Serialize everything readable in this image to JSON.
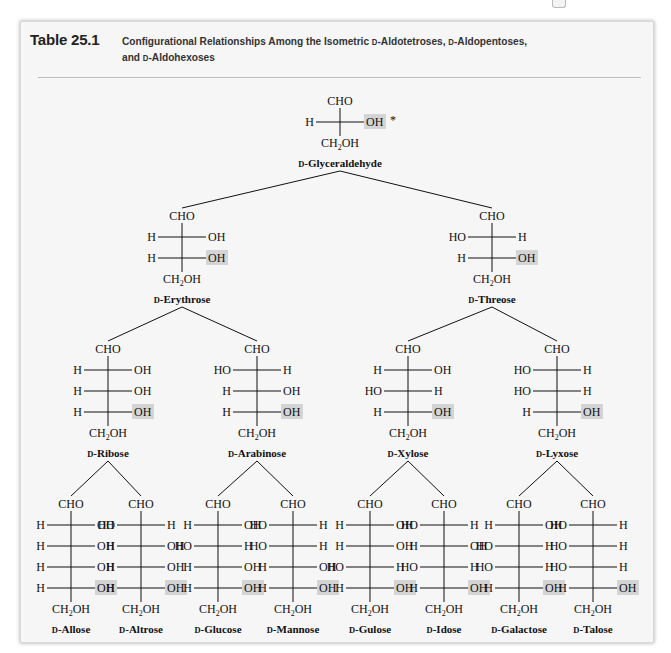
{
  "header": {
    "table_number": "Table 25.1",
    "caption_parts": [
      "Configurational Relationships Among the Isometric ",
      "D",
      "-Aldotetroses, ",
      "D",
      "-Aldopentoses,",
      "and ",
      "D",
      "-Aldohexoses"
    ]
  },
  "colors": {
    "card_bg": "#f6f6f6",
    "highlight": "#d4d4d4",
    "text": "#111111",
    "rule": "#bdbdbd"
  },
  "tree": {
    "asterisk": "*",
    "group_labels": {
      "cho": "CHO",
      "ch2oh_prefix": "CH",
      "ch2oh_sub": "2",
      "ch2oh_suffix": "OH",
      "h": "H",
      "oh": "OH",
      "ho": "HO",
      "d_prefix": "D"
    },
    "nodes": [
      {
        "id": "glyceraldehyde",
        "name": "-Glyceraldehyde",
        "cx": 340,
        "top": 95,
        "config": [
          "R"
        ],
        "highlight_last": true,
        "asterisk": true,
        "parent": null
      },
      {
        "id": "erythrose",
        "name": "-Erythrose",
        "cx": 182,
        "top": 210,
        "config": [
          "R",
          "R"
        ],
        "highlight_last": true,
        "parent": "glyceraldehyde"
      },
      {
        "id": "threose",
        "name": "-Threose",
        "cx": 492,
        "top": 210,
        "config": [
          "L",
          "R"
        ],
        "highlight_last": true,
        "parent": "glyceraldehyde"
      },
      {
        "id": "ribose",
        "name": "-Ribose",
        "cx": 108,
        "top": 343,
        "config": [
          "R",
          "R",
          "R"
        ],
        "highlight_last": true,
        "parent": "erythrose"
      },
      {
        "id": "arabinose",
        "name": "-Arabinose",
        "cx": 257,
        "top": 343,
        "config": [
          "L",
          "R",
          "R"
        ],
        "highlight_last": true,
        "parent": "erythrose"
      },
      {
        "id": "xylose",
        "name": "-Xylose",
        "cx": 408,
        "top": 343,
        "config": [
          "R",
          "L",
          "R"
        ],
        "highlight_last": true,
        "parent": "threose"
      },
      {
        "id": "lyxose",
        "name": "-Lyxose",
        "cx": 557,
        "top": 343,
        "config": [
          "L",
          "L",
          "R"
        ],
        "highlight_last": true,
        "parent": "threose"
      },
      {
        "id": "allose",
        "name": "-Allose",
        "cx": 71,
        "top": 498,
        "config": [
          "R",
          "R",
          "R",
          "R"
        ],
        "highlight_last": true,
        "parent": "ribose"
      },
      {
        "id": "altrose",
        "name": "-Altrose",
        "cx": 141,
        "top": 498,
        "config": [
          "L",
          "R",
          "R",
          "R"
        ],
        "highlight_last": true,
        "parent": "ribose"
      },
      {
        "id": "glucose",
        "name": "-Glucose",
        "cx": 218,
        "top": 498,
        "config": [
          "R",
          "L",
          "R",
          "R"
        ],
        "highlight_last": true,
        "parent": "arabinose"
      },
      {
        "id": "mannose",
        "name": "-Mannose",
        "cx": 293,
        "top": 498,
        "config": [
          "L",
          "L",
          "R",
          "R"
        ],
        "highlight_last": true,
        "parent": "arabinose"
      },
      {
        "id": "gulose",
        "name": "-Gulose",
        "cx": 370,
        "top": 498,
        "config": [
          "R",
          "R",
          "L",
          "R"
        ],
        "highlight_last": true,
        "parent": "xylose"
      },
      {
        "id": "idose",
        "name": "-Idose",
        "cx": 444,
        "top": 498,
        "config": [
          "L",
          "R",
          "L",
          "R"
        ],
        "highlight_last": true,
        "parent": "xylose"
      },
      {
        "id": "galactose",
        "name": "-Galactose",
        "cx": 519,
        "top": 498,
        "config": [
          "R",
          "L",
          "L",
          "R"
        ],
        "highlight_last": true,
        "parent": "lyxose"
      },
      {
        "id": "talose",
        "name": "-Talose",
        "cx": 593,
        "top": 498,
        "config": [
          "L",
          "L",
          "L",
          "R"
        ],
        "highlight_last": true,
        "parent": "lyxose"
      }
    ]
  }
}
